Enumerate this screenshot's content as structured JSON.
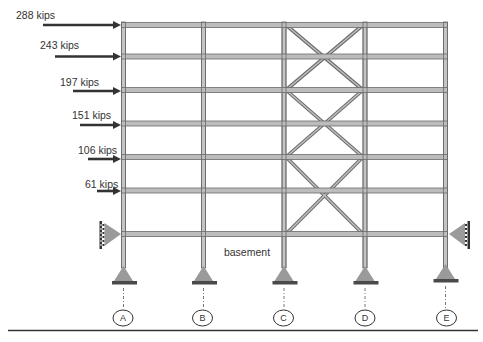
{
  "diagram": {
    "type": "braced steel frame elevation",
    "colors": {
      "member_fill": "#b8b8b8",
      "member_edge": "#6a6a6a",
      "arrow": "#333333",
      "support_triangle": "#9a9a9a",
      "support_plate": "#4a4a4a",
      "text": "#333333"
    },
    "loads": [
      {
        "label": "288 kips",
        "level": 0
      },
      {
        "label": "243 kips",
        "level": 1
      },
      {
        "label": "197 kips",
        "level": 2
      },
      {
        "label": "151 kips",
        "level": 3
      },
      {
        "label": "106 kips",
        "level": 4
      },
      {
        "label": "61 kips",
        "level": 5
      }
    ],
    "basement_label": "basement",
    "grid_lines": [
      "A",
      "B",
      "C",
      "D",
      "E"
    ],
    "braced_bay": "C-D"
  }
}
